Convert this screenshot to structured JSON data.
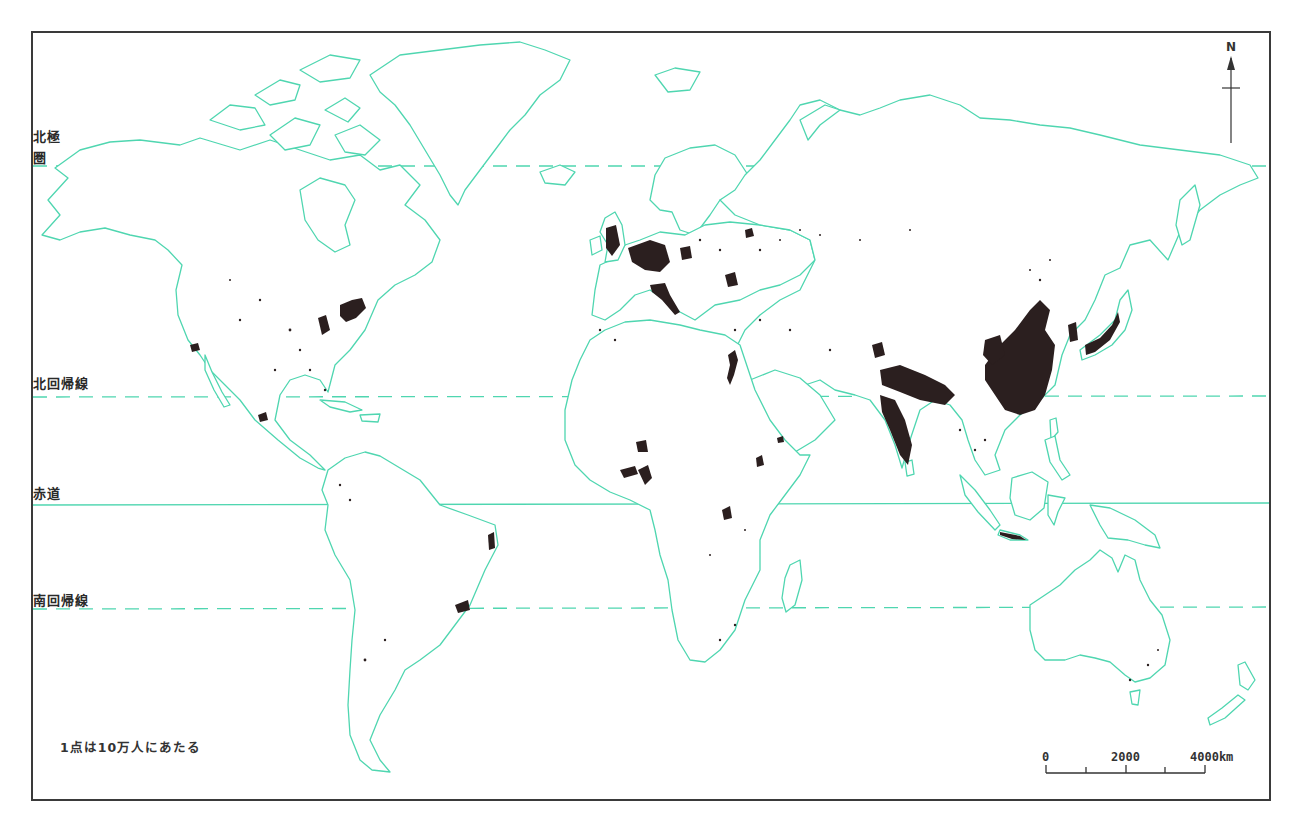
{
  "map": {
    "type": "dot-density world population map",
    "projection": "Miller cylindrical (world, Atlantic-centered)",
    "line_color": "#4fd6b0",
    "dot_color": "#2b1f1f",
    "frame_color": "#3a3a3a"
  },
  "latitude_lines": [
    {
      "id": "arctic-circle",
      "label_line1": "北極",
      "label_line2": "圏",
      "style": "dashed",
      "y": 166
    },
    {
      "id": "tropic-of-cancer",
      "label": "北回帰線",
      "style": "dashed",
      "y": 397
    },
    {
      "id": "equator",
      "label": "赤道",
      "style": "solid",
      "y": 505
    },
    {
      "id": "tropic-of-capricorn",
      "label": "南回帰線",
      "style": "dashed",
      "y": 609
    }
  ],
  "legend": {
    "text": "1点は10万人にあたる"
  },
  "scale_bar": {
    "labels": [
      "0",
      "2000",
      "4000km"
    ],
    "unit": "km",
    "max": 4000
  },
  "north_arrow": {
    "label": "N"
  },
  "population_clusters": [
    {
      "region": "Eastern China",
      "density": "very high"
    },
    {
      "region": "Northern India / Ganges plain",
      "density": "very high"
    },
    {
      "region": "Japan",
      "density": "very high"
    },
    {
      "region": "Western & Central Europe",
      "density": "high"
    },
    {
      "region": "Java (Indonesia)",
      "density": "high"
    },
    {
      "region": "Nile valley (Egypt)",
      "density": "high"
    },
    {
      "region": "US Northeast",
      "density": "medium"
    },
    {
      "region": "Nigeria / West Africa coast",
      "density": "medium"
    },
    {
      "region": "Southeast Brazil",
      "density": "medium"
    },
    {
      "region": "Ethiopian highlands",
      "density": "medium"
    },
    {
      "region": "Great Lakes Africa",
      "density": "medium"
    }
  ]
}
